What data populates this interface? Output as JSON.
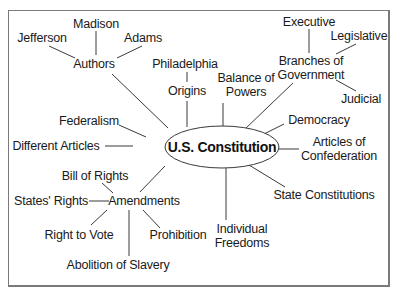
{
  "diagram": {
    "title": "U.S. Constitution",
    "center": {
      "label": "U.S. Constitution",
      "cx": 222,
      "cy": 147,
      "rx": 57,
      "ry": 21
    },
    "nodes": [
      {
        "id": "authors",
        "label": "Authors",
        "x": 94,
        "y": 64
      },
      {
        "id": "jefferson",
        "label": "Jefferson",
        "x": 42,
        "y": 38
      },
      {
        "id": "madison",
        "label": "Madison",
        "x": 96,
        "y": 24
      },
      {
        "id": "adams",
        "label": "Adams",
        "x": 143,
        "y": 38
      },
      {
        "id": "philadelphia",
        "label": "Philadelphia",
        "x": 185,
        "y": 64
      },
      {
        "id": "origins",
        "label": "Origins",
        "x": 187,
        "y": 91
      },
      {
        "id": "balance",
        "label": "Balance of\nPowers",
        "x": 246,
        "y": 85
      },
      {
        "id": "branches",
        "label": "Branches of\nGovernment",
        "x": 311,
        "y": 68
      },
      {
        "id": "executive",
        "label": "Executive",
        "x": 309,
        "y": 22
      },
      {
        "id": "legislative",
        "label": "Legislative",
        "x": 359,
        "y": 36
      },
      {
        "id": "judicial",
        "label": "Judicial",
        "x": 361,
        "y": 99
      },
      {
        "id": "democracy",
        "label": "Democracy",
        "x": 319,
        "y": 120
      },
      {
        "id": "articles_conf",
        "label": "Articles of\nConfederation",
        "x": 339,
        "y": 149
      },
      {
        "id": "state_const",
        "label": "State Constitutions",
        "x": 324,
        "y": 195
      },
      {
        "id": "individual",
        "label": "Individual\nFreedoms",
        "x": 242,
        "y": 236
      },
      {
        "id": "federalism",
        "label": "Federalism",
        "x": 89,
        "y": 121
      },
      {
        "id": "different_articles",
        "label": "Different Articles",
        "x": 56,
        "y": 146
      },
      {
        "id": "amendments",
        "label": "Amendments",
        "x": 144,
        "y": 201
      },
      {
        "id": "bill_of_rights",
        "label": "Bill of Rights",
        "x": 95,
        "y": 176
      },
      {
        "id": "states_rights",
        "label": "States' Rights",
        "x": 51,
        "y": 201
      },
      {
        "id": "right_to_vote",
        "label": "Right to Vote",
        "x": 79,
        "y": 235
      },
      {
        "id": "prohibition",
        "label": "Prohibition",
        "x": 178,
        "y": 235
      },
      {
        "id": "abolition",
        "label": "Abolition of Slavery",
        "x": 118,
        "y": 265
      }
    ],
    "edges": [
      {
        "from": "authors",
        "to": "center",
        "x1": 112,
        "y1": 74,
        "x2": 168,
        "y2": 128
      },
      {
        "from": "authors",
        "to": "jefferson",
        "x1": 75,
        "y1": 58,
        "x2": 49,
        "y2": 46
      },
      {
        "from": "authors",
        "to": "madison",
        "x1": 96,
        "y1": 55,
        "x2": 96,
        "y2": 31
      },
      {
        "from": "authors",
        "to": "adams",
        "x1": 117,
        "y1": 58,
        "x2": 142,
        "y2": 46
      },
      {
        "from": "origins",
        "to": "center",
        "x1": 187,
        "y1": 101,
        "x2": 187,
        "y2": 127
      },
      {
        "from": "origins",
        "to": "philadelphia",
        "x1": 187,
        "y1": 82,
        "x2": 187,
        "y2": 72
      },
      {
        "from": "balance",
        "to": "center",
        "x1": 223,
        "y1": 103,
        "x2": 223,
        "y2": 126
      },
      {
        "from": "branches",
        "to": "center",
        "x1": 293,
        "y1": 83,
        "x2": 244,
        "y2": 130
      },
      {
        "from": "branches",
        "to": "executive",
        "x1": 309,
        "y1": 53,
        "x2": 309,
        "y2": 29
      },
      {
        "from": "branches",
        "to": "legislative",
        "x1": 336,
        "y1": 54,
        "x2": 356,
        "y2": 44
      },
      {
        "from": "branches",
        "to": "judicial",
        "x1": 336,
        "y1": 80,
        "x2": 356,
        "y2": 91
      },
      {
        "from": "democracy",
        "to": "center",
        "x1": 284,
        "y1": 124,
        "x2": 262,
        "y2": 135
      },
      {
        "from": "articles_conf",
        "to": "center",
        "x1": 299,
        "y1": 149,
        "x2": 279,
        "y2": 149
      },
      {
        "from": "state_const",
        "to": "center",
        "x1": 285,
        "y1": 187,
        "x2": 249,
        "y2": 165
      },
      {
        "from": "individual",
        "to": "center",
        "x1": 226,
        "y1": 220,
        "x2": 226,
        "y2": 168
      },
      {
        "from": "federalism",
        "to": "center",
        "x1": 119,
        "y1": 125,
        "x2": 146,
        "y2": 137
      },
      {
        "from": "different_articles",
        "to": "center",
        "x1": 105,
        "y1": 146,
        "x2": 133,
        "y2": 146
      },
      {
        "from": "amendments",
        "to": "center",
        "x1": 140,
        "y1": 192,
        "x2": 165,
        "y2": 166
      },
      {
        "from": "amendments",
        "to": "bill_of_rights",
        "x1": 113,
        "y1": 193,
        "x2": 102,
        "y2": 183
      },
      {
        "from": "amendments",
        "to": "states_rights",
        "x1": 109,
        "y1": 201,
        "x2": 89,
        "y2": 201
      },
      {
        "from": "amendments",
        "to": "right_to_vote",
        "x1": 107,
        "y1": 210,
        "x2": 91,
        "y2": 225
      },
      {
        "from": "amendments",
        "to": "prohibition",
        "x1": 143,
        "y1": 210,
        "x2": 160,
        "y2": 228
      },
      {
        "from": "amendments",
        "to": "abolition",
        "x1": 129,
        "y1": 210,
        "x2": 129,
        "y2": 256
      }
    ]
  }
}
